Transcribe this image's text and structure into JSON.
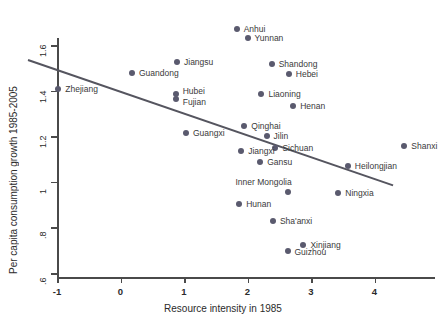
{
  "chart_data": {
    "type": "scatter",
    "title": "",
    "xlabel": "Resource intensity in 1985",
    "ylabel": "Per capita consumption growth 1985-2005",
    "xlim": [
      -1.45,
      4.9
    ],
    "ylim": [
      0.58,
      1.72
    ],
    "xticks": [
      -1,
      0,
      1,
      2,
      3,
      4
    ],
    "xticklabels": [
      "-1",
      "0",
      "1",
      "2",
      "3",
      "4"
    ],
    "yticks": [
      0.6,
      0.8,
      1.0,
      1.2,
      1.4,
      1.6
    ],
    "yticklabels": [
      ".6",
      ".8",
      "1",
      "1.2",
      "1.4",
      "1.6"
    ],
    "grid": false,
    "legend": "none",
    "marker_color": "#5a5a6e",
    "trendline_color": "#55555f",
    "axis_color": "#4a4a4a",
    "trendline": {
      "x0": -1.45,
      "y0": 1.535,
      "x1": 4.3,
      "y1": 0.985
    },
    "points": [
      {
        "label": "Anhui",
        "x": 1.83,
        "y": 1.672,
        "lx": 7,
        "ly": -4
      },
      {
        "label": "Yunnan",
        "x": 2.0,
        "y": 1.632,
        "lx": 7,
        "ly": -4
      },
      {
        "label": "Jiangsu",
        "x": 0.89,
        "y": 1.525,
        "lx": 7,
        "ly": -4
      },
      {
        "label": "Guandong",
        "x": 0.18,
        "y": 1.478,
        "lx": 7,
        "ly": -4
      },
      {
        "label": "Shandong",
        "x": 2.38,
        "y": 1.518,
        "lx": 7,
        "ly": -4
      },
      {
        "label": "Hebei",
        "x": 2.65,
        "y": 1.473,
        "lx": 7,
        "ly": -4
      },
      {
        "label": "Zhejiang",
        "x": -0.98,
        "y": 1.405,
        "lx": 7,
        "ly": -4
      },
      {
        "label": "Hubei",
        "x": 0.87,
        "y": 1.383,
        "lx": 7,
        "ly": -7
      },
      {
        "label": "Fujian",
        "x": 0.87,
        "y": 1.363,
        "lx": 7,
        "ly": -1
      },
      {
        "label": "Liaoning",
        "x": 2.22,
        "y": 1.383,
        "lx": 7,
        "ly": -4
      },
      {
        "label": "Henan",
        "x": 2.72,
        "y": 1.333,
        "lx": 7,
        "ly": -4
      },
      {
        "label": "Qinghai",
        "x": 1.95,
        "y": 1.245,
        "lx": 7,
        "ly": -4
      },
      {
        "label": "Guangxi",
        "x": 1.03,
        "y": 1.215,
        "lx": 7,
        "ly": -4
      },
      {
        "label": "Jilin",
        "x": 2.3,
        "y": 1.203,
        "lx": 7,
        "ly": -4
      },
      {
        "label": "Shanxi",
        "x": 4.47,
        "y": 1.155,
        "lx": 7,
        "ly": -4
      },
      {
        "label": "Sichuan",
        "x": 2.44,
        "y": 1.15,
        "lx": 7,
        "ly": -4
      },
      {
        "label": "Jiangxi",
        "x": 1.9,
        "y": 1.133,
        "lx": 7,
        "ly": -4
      },
      {
        "label": "Gansu",
        "x": 2.2,
        "y": 1.085,
        "lx": 7,
        "ly": -4
      },
      {
        "label": "Heilongjian",
        "x": 3.58,
        "y": 1.07,
        "lx": 7,
        "ly": -4
      },
      {
        "label": "Inner Mongolia",
        "x": 2.63,
        "y": 0.955,
        "lx": -52,
        "ly": -14
      },
      {
        "label": "Ningxia",
        "x": 3.43,
        "y": 0.953,
        "lx": 7,
        "ly": -4
      },
      {
        "label": "Hunan",
        "x": 1.87,
        "y": 0.902,
        "lx": 7,
        "ly": -4
      },
      {
        "label": "Sha'anxi",
        "x": 2.4,
        "y": 0.828,
        "lx": 7,
        "ly": -4
      },
      {
        "label": "Xinjiang",
        "x": 2.88,
        "y": 0.725,
        "lx": 7,
        "ly": -4
      },
      {
        "label": "Guizhou",
        "x": 2.63,
        "y": 0.698,
        "lx": 7,
        "ly": -3
      }
    ]
  }
}
